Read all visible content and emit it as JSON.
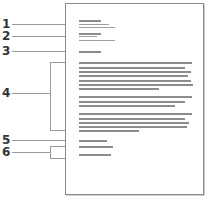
{
  "diagram": {
    "type": "document-layout-callouts",
    "callouts": [
      {
        "number": "1",
        "target": "header block"
      },
      {
        "number": "2",
        "target": "address block"
      },
      {
        "number": "3",
        "target": "date/reference line"
      },
      {
        "number": "4",
        "target": "body paragraphs"
      },
      {
        "number": "5",
        "target": "closing line"
      },
      {
        "number": "6",
        "target": "signature lines"
      }
    ],
    "colors": {
      "text_lines": "#8c8c8c",
      "callout_lines": "#9a9a9a",
      "page_border": "#8a8a8a",
      "labels": "#333333"
    }
  },
  "labels": {
    "l1": "1",
    "l2": "2",
    "l3": "3",
    "l4": "4",
    "l5": "5",
    "l6": "6"
  }
}
